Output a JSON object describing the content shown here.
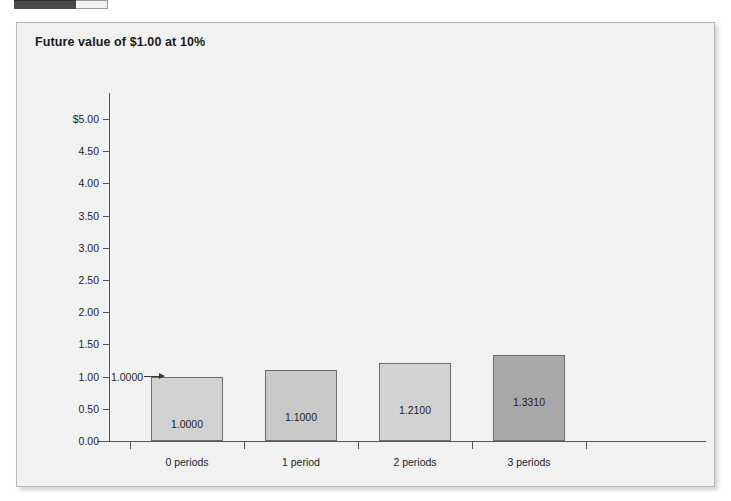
{
  "toolbar_fragment": {
    "name": "cut-off-toolbar-fragment"
  },
  "panel": {
    "title": "Future value of $1.00 at 10%",
    "background": "#f1f1f1",
    "border_color": "#b9b9b9"
  },
  "annotation": {
    "label": "1.0000"
  },
  "chart_data": {
    "type": "bar",
    "title": "Future value of $1.00 at 10%",
    "xlabel": "",
    "ylabel": "",
    "categories": [
      "0 periods",
      "1 period",
      "2 periods",
      "3 periods"
    ],
    "values": [
      1.0,
      1.1,
      1.21,
      1.331
    ],
    "value_labels": [
      "1.0000",
      "1.1000",
      "1.2100",
      "1.3310"
    ],
    "ylim": [
      0.0,
      5.0
    ],
    "ytick_labels": [
      "$5.00",
      "4.50",
      "4.00",
      "3.50",
      "3.00",
      "2.50",
      "2.00",
      "1.50",
      "1.00",
      "0.50",
      "0.00"
    ],
    "ytick_values": [
      5.0,
      4.5,
      4.0,
      3.5,
      3.0,
      2.5,
      2.0,
      1.5,
      1.0,
      0.5,
      0.0
    ],
    "grid": false,
    "legend": null,
    "bar_colors": [
      "#d2d2d2",
      "#c9c9c9",
      "#d2d2d2",
      "#a8a8a8"
    ],
    "bar_border_color": "#6e6e6e",
    "annotations": [
      {
        "text": "1.0000",
        "points_to_category": "0 periods",
        "value": 1.0
      }
    ]
  }
}
